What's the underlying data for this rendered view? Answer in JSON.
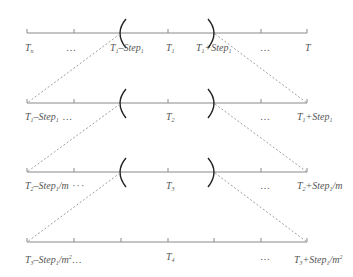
{
  "diagram": {
    "colors": {
      "line": "#8a8a8a",
      "dash": "#a0a0a0",
      "paren": "#222222",
      "text": "#555555"
    },
    "rows": [
      {
        "id": "row-1",
        "labels": {
          "left": {
            "base": "T",
            "sub": "n"
          },
          "dots_left": "…",
          "paren_left": {
            "base": "T",
            "sub": "1",
            "op": "–Step",
            "op_sub": "1"
          },
          "center": {
            "base": "T",
            "sub": "1"
          },
          "paren_right": {
            "base": "T",
            "sub": "1",
            "op": "+Step",
            "op_sub": "1"
          },
          "dots_right": "…",
          "right": {
            "base": "T"
          }
        }
      },
      {
        "id": "row-2",
        "labels": {
          "left": {
            "base": "T",
            "sub": "1",
            "op": "–Step",
            "op_sub": "1",
            "tail": " …"
          },
          "center": {
            "base": "T",
            "sub": "2"
          },
          "dots_right": "…",
          "right": {
            "base": "T",
            "sub": "1",
            "op": "+Step",
            "op_sub": "1"
          }
        }
      },
      {
        "id": "row-3",
        "labels": {
          "left": {
            "base": "T",
            "sub": "2",
            "op": "–Step",
            "op_sub": "1",
            "div": "/m",
            "tail": " ···"
          },
          "center": {
            "base": "T",
            "sub": "3"
          },
          "dots_right": "…",
          "right": {
            "base": "T",
            "sub": "2",
            "op": "+Step",
            "op_sub": "1",
            "div": "/m"
          }
        }
      },
      {
        "id": "row-4",
        "labels": {
          "left": {
            "base": "T",
            "sub": "3",
            "op": "–Step",
            "op_sub": "1",
            "div": "/m",
            "div_sup": "2",
            "tail": "…"
          },
          "center": {
            "base": "T",
            "sub": "4"
          },
          "dots_right": "…",
          "right": {
            "base": "T",
            "sub": "3",
            "op": "+Step",
            "op_sub": "1",
            "div": "/m",
            "div_sup": "2"
          }
        }
      }
    ]
  }
}
